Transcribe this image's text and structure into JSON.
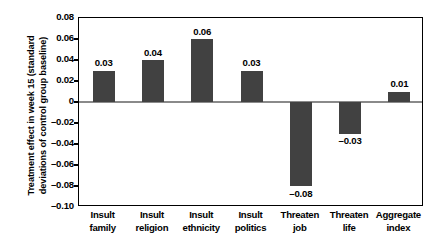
{
  "chart_data": {
    "type": "bar",
    "title": "",
    "xlabel": "",
    "ylabel": "Treatment effect in week 15 (standard deviations of control group baseline)",
    "categories": [
      "Insult family",
      "Insult religion",
      "Insult ethnicity",
      "Insult politics",
      "Threaten job",
      "Threaten life",
      "Aggregate index"
    ],
    "category_lines": [
      [
        "Insult",
        "family"
      ],
      [
        "Insult",
        "religion"
      ],
      [
        "Insult",
        "ethnicity"
      ],
      [
        "Insult",
        "politics"
      ],
      [
        "Threaten",
        "job"
      ],
      [
        "Threaten",
        "life"
      ],
      [
        "Aggregate",
        "index"
      ]
    ],
    "values": [
      0.03,
      0.04,
      0.06,
      0.03,
      -0.08,
      -0.03,
      0.01
    ],
    "value_labels": [
      "0.03",
      "0.04",
      "0.06",
      "0.03",
      "–0.08",
      "–0.03",
      "0.01"
    ],
    "ylim": [
      -0.1,
      0.08
    ],
    "yticks": [
      0.08,
      0.06,
      0.04,
      0.02,
      0,
      -0.02,
      -0.04,
      -0.06,
      -0.08,
      -0.1
    ],
    "ytick_labels": [
      "0.08",
      "0.06",
      "0.04",
      "0.02",
      "0",
      "–0.02",
      "–0.04",
      "–0.06",
      "–0.08",
      "–0.10"
    ],
    "grid": false,
    "legend": "none",
    "bar_color": "#414141",
    "zero_line_color": "#8a8a8a",
    "axis_color": "#000000"
  }
}
